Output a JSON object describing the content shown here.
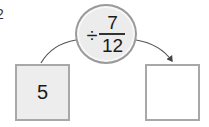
{
  "problem": {
    "number": "2"
  },
  "operation": {
    "sign": "÷",
    "fraction": {
      "numerator": "7",
      "denominator": "12"
    }
  },
  "input_box": {
    "value": "5"
  },
  "output_box": {
    "value": ""
  },
  "colors": {
    "circle_fill": "#ececec",
    "circle_border": "#9a9a9a",
    "input_box_fill": "#ededed",
    "output_box_fill": "#ffffff",
    "box_border": "#a8a8a8",
    "arrow": "#444444"
  }
}
